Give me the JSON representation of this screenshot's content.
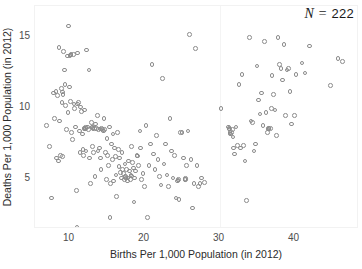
{
  "figure": {
    "background": "#ffffff",
    "marker_color": "#8c8c8c",
    "axis_text_color": "#2b2b2b"
  },
  "annotation": {
    "symbol": "N",
    "equals": "=",
    "value": "222",
    "full_text": "N = 222"
  },
  "axes": {
    "x_label": "Births Per 1,000 Population (in 2012)",
    "y_label": "Deaths Per 1,000 Population (in 2012)",
    "x_ticks": [
      "10",
      "20",
      "30",
      "40"
    ],
    "y_ticks": [
      "5",
      "10",
      "15"
    ]
  },
  "chart_data": {
    "type": "scatter",
    "title": "",
    "subtitle": "",
    "xlabel": "Births Per 1,000 Population (in 2012)",
    "ylabel": "Deaths Per 1,000 Population (in 2012)",
    "xlim": [
      5.5,
      48.8
    ],
    "ylim": [
      0.6,
      17.6
    ],
    "xticks": [
      10,
      20,
      30,
      40
    ],
    "yticks": [
      5,
      10,
      15
    ],
    "grid": "faint vertical gridline at x = 30",
    "legend": null,
    "legend_position": null,
    "n_points": 222,
    "annotations": [
      {
        "text": "N = 222",
        "position": "top-right",
        "italic": true
      }
    ],
    "marker": {
      "shape": "open-circle",
      "size_px": 4.6,
      "edge_color": "#8c8c8c",
      "fill": "none"
    },
    "series": [
      {
        "name": "countries",
        "points": [
          [
            6.9,
            8.7
          ],
          [
            7.3,
            7.2
          ],
          [
            7.6,
            3.6
          ],
          [
            7.9,
            11.0
          ],
          [
            8.0,
            9.2
          ],
          [
            8.2,
            11.1
          ],
          [
            8.3,
            6.4
          ],
          [
            8.4,
            10.8
          ],
          [
            8.5,
            6.2
          ],
          [
            8.6,
            14.2
          ],
          [
            8.7,
            9.0
          ],
          [
            8.8,
            6.6
          ],
          [
            8.9,
            11.3
          ],
          [
            9.0,
            10.3
          ],
          [
            9.1,
            6.5
          ],
          [
            9.2,
            13.9
          ],
          [
            9.3,
            12.6
          ],
          [
            9.4,
            11.6
          ],
          [
            9.5,
            10.1
          ],
          [
            9.6,
            8.4
          ],
          [
            9.7,
            13.6
          ],
          [
            9.8,
            9.6
          ],
          [
            9.9,
            15.7
          ],
          [
            10.0,
            11.4
          ],
          [
            10.1,
            10.4
          ],
          [
            10.2,
            13.7
          ],
          [
            10.3,
            8.2
          ],
          [
            10.4,
            7.7
          ],
          [
            10.5,
            13.7
          ],
          [
            10.6,
            10.2
          ],
          [
            10.7,
            9.9
          ],
          [
            10.8,
            8.6
          ],
          [
            10.9,
            4.1
          ],
          [
            11.0,
            1.5
          ],
          [
            11.1,
            13.8
          ],
          [
            11.2,
            10.3
          ],
          [
            11.3,
            8.3
          ],
          [
            11.4,
            6.8
          ],
          [
            11.5,
            10.0
          ],
          [
            11.6,
            9.7
          ],
          [
            11.7,
            8.1
          ],
          [
            11.8,
            7.0
          ],
          [
            11.9,
            6.6
          ],
          [
            12.0,
            9.8
          ],
          [
            12.1,
            8.5
          ],
          [
            12.2,
            6.9
          ],
          [
            12.3,
            14.0
          ],
          [
            12.4,
            8.6
          ],
          [
            12.5,
            8.4
          ],
          [
            12.6,
            12.6
          ],
          [
            12.7,
            6.4
          ],
          [
            12.8,
            4.6
          ],
          [
            12.9,
            8.9
          ],
          [
            13.0,
            8.6
          ],
          [
            13.1,
            7.2
          ],
          [
            13.2,
            6.8
          ],
          [
            13.3,
            8.5
          ],
          [
            13.4,
            5.1
          ],
          [
            13.5,
            8.8
          ],
          [
            13.6,
            8.5
          ],
          [
            13.7,
            9.4
          ],
          [
            13.8,
            6.9
          ],
          [
            13.9,
            8.4
          ],
          [
            14.0,
            7.1
          ],
          [
            14.1,
            6.4
          ],
          [
            14.2,
            5.6
          ],
          [
            14.3,
            8.5
          ],
          [
            14.4,
            8.4
          ],
          [
            14.5,
            8.3
          ],
          [
            14.6,
            9.2
          ],
          [
            14.7,
            8.4
          ],
          [
            14.8,
            6.8
          ],
          [
            14.9,
            4.9
          ],
          [
            15.0,
            7.8
          ],
          [
            15.1,
            6.6
          ],
          [
            15.2,
            5.9
          ],
          [
            15.3,
            8.6
          ],
          [
            15.4,
            2.2
          ],
          [
            15.5,
            4.6
          ],
          [
            15.6,
            7.4
          ],
          [
            15.7,
            6.3
          ],
          [
            15.8,
            8.1
          ],
          [
            15.9,
            4.8
          ],
          [
            16.0,
            7.1
          ],
          [
            16.1,
            6.5
          ],
          [
            16.2,
            5.2
          ],
          [
            16.3,
            3.7
          ],
          [
            16.4,
            8.2
          ],
          [
            16.5,
            7.0
          ],
          [
            16.6,
            5.8
          ],
          [
            16.7,
            6.4
          ],
          [
            16.8,
            5.4
          ],
          [
            16.9,
            5.0
          ],
          [
            17.0,
            6.8
          ],
          [
            17.1,
            5.6
          ],
          [
            17.2,
            5.3
          ],
          [
            17.3,
            4.9
          ],
          [
            17.4,
            6.0
          ],
          [
            17.5,
            5.1
          ],
          [
            17.6,
            5.6
          ],
          [
            17.7,
            4.8
          ],
          [
            17.8,
            5.0
          ],
          [
            17.9,
            6.2
          ],
          [
            18.0,
            5.5
          ],
          [
            18.1,
            4.9
          ],
          [
            18.2,
            5.2
          ],
          [
            18.3,
            7.2
          ],
          [
            18.4,
            6.1
          ],
          [
            18.5,
            5.7
          ],
          [
            18.6,
            3.3
          ],
          [
            18.7,
            5.0
          ],
          [
            18.8,
            5.5
          ],
          [
            19.0,
            6.6
          ],
          [
            19.2,
            5.9
          ],
          [
            19.4,
            8.3
          ],
          [
            19.5,
            7.1
          ],
          [
            19.6,
            4.9
          ],
          [
            19.8,
            5.3
          ],
          [
            20.0,
            4.4
          ],
          [
            20.2,
            8.7
          ],
          [
            20.4,
            2.2
          ],
          [
            20.6,
            5.9
          ],
          [
            20.8,
            7.4
          ],
          [
            21.0,
            13.0
          ],
          [
            21.2,
            6.7
          ],
          [
            21.4,
            5.6
          ],
          [
            21.6,
            8.0
          ],
          [
            21.8,
            6.3
          ],
          [
            22.0,
            5.1
          ],
          [
            22.2,
            4.5
          ],
          [
            22.4,
            12.0
          ],
          [
            22.6,
            6.0
          ],
          [
            22.8,
            7.4
          ],
          [
            23.0,
            5.2
          ],
          [
            23.2,
            4.4
          ],
          [
            23.4,
            9.2
          ],
          [
            23.6,
            6.9
          ],
          [
            23.8,
            5.0
          ],
          [
            24.0,
            6.6
          ],
          [
            24.2,
            3.6
          ],
          [
            24.4,
            4.8
          ],
          [
            24.5,
            4.9
          ],
          [
            24.6,
            3.5
          ],
          [
            24.8,
            8.2
          ],
          [
            25.0,
            8.2
          ],
          [
            25.2,
            6.4
          ],
          [
            25.4,
            4.9
          ],
          [
            25.5,
            4.9
          ],
          [
            25.6,
            5.9
          ],
          [
            25.8,
            8.3
          ],
          [
            26.0,
            15.1
          ],
          [
            26.2,
            6.3
          ],
          [
            26.4,
            2.9
          ],
          [
            26.6,
            4.6
          ],
          [
            26.8,
            14.1
          ],
          [
            27.0,
            5.9
          ],
          [
            27.2,
            4.4
          ],
          [
            27.4,
            4.6
          ],
          [
            27.6,
            5.0
          ],
          [
            28.0,
            4.7
          ],
          [
            30.2,
            9.9
          ],
          [
            31.2,
            8.6
          ],
          [
            31.4,
            8.2
          ],
          [
            31.5,
            8.1
          ],
          [
            31.6,
            8.2
          ],
          [
            31.7,
            8.4
          ],
          [
            31.8,
            7.9
          ],
          [
            31.9,
            7.1
          ],
          [
            32.0,
            6.7
          ],
          [
            32.2,
            8.6
          ],
          [
            32.4,
            7.3
          ],
          [
            32.6,
            11.6
          ],
          [
            32.8,
            7.1
          ],
          [
            33.0,
            12.3
          ],
          [
            33.2,
            7.3
          ],
          [
            33.4,
            6.2
          ],
          [
            33.6,
            3.4
          ],
          [
            34.0,
            14.9
          ],
          [
            34.2,
            9.0
          ],
          [
            34.4,
            8.9
          ],
          [
            34.6,
            6.9
          ],
          [
            34.8,
            7.4
          ],
          [
            35.0,
            12.9
          ],
          [
            35.2,
            10.5
          ],
          [
            35.4,
            9.5
          ],
          [
            35.6,
            11.0
          ],
          [
            35.8,
            8.7
          ],
          [
            36.0,
            14.6
          ],
          [
            36.2,
            9.6
          ],
          [
            36.4,
            8.2
          ],
          [
            36.6,
            8.5
          ],
          [
            36.8,
            8.5
          ],
          [
            37.0,
            12.2
          ],
          [
            37.2,
            10.9
          ],
          [
            37.4,
            9.8
          ],
          [
            37.6,
            8.0
          ],
          [
            37.8,
            14.9
          ],
          [
            38.0,
            13.0
          ],
          [
            38.2,
            12.7
          ],
          [
            38.4,
            11.9
          ],
          [
            38.6,
            14.4
          ],
          [
            38.8,
            9.4
          ],
          [
            39.0,
            12.6
          ],
          [
            39.2,
            12.7
          ],
          [
            39.4,
            11.1
          ],
          [
            39.6,
            8.8
          ],
          [
            40.0,
            9.4
          ],
          [
            40.2,
            12.3
          ],
          [
            41.0,
            13.1
          ],
          [
            41.4,
            12.4
          ],
          [
            42.0,
            14.3
          ],
          [
            44.8,
            11.5
          ],
          [
            45.8,
            13.4
          ],
          [
            46.4,
            13.2
          ],
          [
            9.05,
            11.05
          ],
          [
            9.15,
            10.9
          ],
          [
            10.05,
            13.6
          ],
          [
            10.15,
            13.65
          ],
          [
            11.05,
            10.2
          ],
          [
            11.95,
            8.5
          ],
          [
            12.05,
            8.45
          ],
          [
            13.05,
            8.55
          ],
          [
            13.15,
            8.5
          ],
          [
            14.05,
            8.45
          ],
          [
            17.45,
            5.05
          ],
          [
            17.55,
            5.0
          ],
          [
            24.45,
            4.85
          ],
          [
            31.25,
            8.5
          ],
          [
            31.35,
            8.45
          ],
          [
            36.45,
            8.45
          ],
          [
            36.55,
            8.5
          ],
          [
            18.25,
            5.15
          ],
          [
            19.05,
            6.55
          ],
          [
            12.15,
            8.55
          ],
          [
            25.45,
            4.95
          ],
          [
            36.9,
            9.9
          ]
        ]
      }
    ]
  }
}
